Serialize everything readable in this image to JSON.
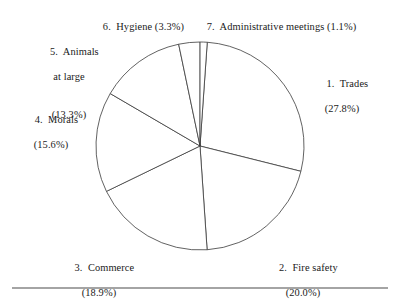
{
  "chart_data": {
    "type": "pie",
    "title": "",
    "subtitle": "",
    "xlabel": "",
    "ylabel": "",
    "legend_position": "none",
    "grid": false,
    "units": "percent",
    "start_angle_deg_from_top_clockwise": 4,
    "direction": "clockwise",
    "categories": [
      "1. Trades",
      "2. Fire safety",
      "3. Commerce",
      "4. Morals",
      "5. Animals at large",
      "6. Hygiene",
      "7. Administrative meetings"
    ],
    "values": [
      27.8,
      20.0,
      18.9,
      15.6,
      13.3,
      3.3,
      1.1
    ],
    "slices": [
      {
        "index": "1.",
        "name": "Trades",
        "value": 27.8,
        "value_label": "(27.8%)"
      },
      {
        "index": "2.",
        "name": "Fire safety",
        "value": 20.0,
        "value_label": "(20.0%)"
      },
      {
        "index": "3.",
        "name": "Commerce",
        "value": 18.9,
        "value_label": "(18.9%)"
      },
      {
        "index": "4.",
        "name": "Morals",
        "value": 15.6,
        "value_label": "(15.6%)"
      },
      {
        "index": "5.",
        "name": "Animals at large",
        "value": 13.3,
        "value_label": "(13.3%)"
      },
      {
        "index": "6.",
        "name": "Hygiene",
        "value": 3.3,
        "value_label": "(3.3%)"
      },
      {
        "index": "7.",
        "name": "Administrative meetings",
        "value": 1.1,
        "value_label": "(1.1%)"
      }
    ]
  },
  "labels": {
    "trades_line1": "1.  Trades",
    "trades_line2": "(27.8%)",
    "fire_safety_line1": "2.  Fire safety",
    "fire_safety_line2": "(20.0%)",
    "commerce_line1": "3.  Commerce",
    "commerce_line2": "(18.9%)",
    "morals_line1": "4.  Morals",
    "morals_line2": "(15.6%)",
    "animals_line1": "5.  Animals",
    "animals_line2": "at large",
    "animals_line3": "(13.3%)",
    "hygiene_line1": "6.  Hygiene (3.3%)",
    "admin_line1": "7.  Administrative meetings (1.1%)"
  },
  "style": {
    "slice_fill": "#ffffff",
    "slice_stroke": "#3a3a3a",
    "text_color": "#1a1a1a",
    "rule_color": "#4a4a4a",
    "background": "#ffffff"
  },
  "geometry": {
    "center_x": 200,
    "center_y": 146,
    "radius": 104,
    "rule_y": 288,
    "rule_x1": 12,
    "rule_x2": 388
  }
}
